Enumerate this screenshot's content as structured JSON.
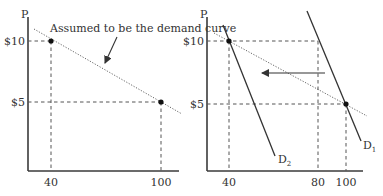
{
  "diagram": {
    "left_panel": {
      "y_axis_label": "P",
      "y_ticks": [
        "$10",
        "$5"
      ],
      "x_ticks": [
        "40",
        "100"
      ],
      "annotation": "Assumed to be the demand curve",
      "points": [
        {
          "q": 40,
          "p": 10
        },
        {
          "q": 100,
          "p": 5
        }
      ]
    },
    "right_panel": {
      "y_axis_label": "P",
      "y_ticks": [
        "$10",
        "$5"
      ],
      "x_ticks": [
        "40",
        "80",
        "100"
      ],
      "curves": [
        {
          "label_main": "D",
          "label_sub": "1",
          "description": "original demand curve through (100, $5) and (80, $10)"
        },
        {
          "label_main": "D",
          "label_sub": "2",
          "description": "shifted demand curve through (40, $10)"
        }
      ],
      "shift_direction": "left",
      "points": [
        {
          "q": 40,
          "p": 10
        },
        {
          "q": 100,
          "p": 5
        }
      ]
    }
  }
}
